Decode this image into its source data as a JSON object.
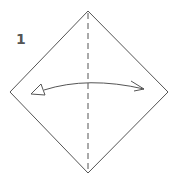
{
  "step": {
    "number": "1"
  },
  "diagram": {
    "shape": "square-diamond",
    "vertices": {
      "top": [
        88,
        11
      ],
      "right": [
        168,
        92
      ],
      "bottom": [
        88,
        173
      ],
      "left": [
        10,
        92
      ]
    },
    "fold_line": {
      "type": "valley-fold-dashed",
      "from": [
        88,
        11
      ],
      "to": [
        88,
        173
      ]
    },
    "arrow": {
      "type": "fold-and-unfold",
      "direction": "bidirectional",
      "from": [
        44,
        90
      ],
      "to": [
        144,
        89
      ]
    },
    "colors": {
      "line": "#555555",
      "background": "#ffffff"
    }
  }
}
